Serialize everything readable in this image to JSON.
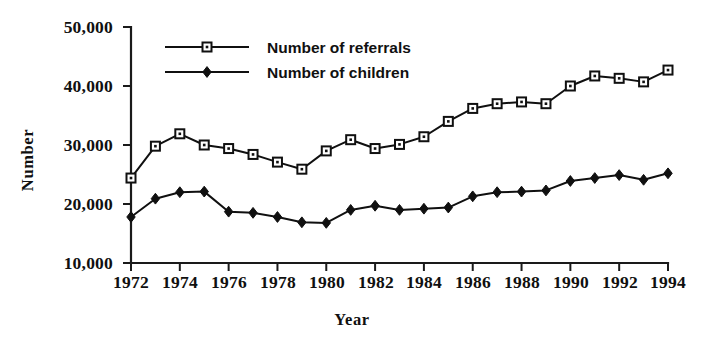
{
  "chart_data": {
    "type": "line",
    "title": "",
    "xlabel": "Year",
    "ylabel": "Number",
    "xlim": [
      1972,
      1994
    ],
    "ylim": [
      10000,
      50000
    ],
    "grid": false,
    "legend_position": "top-center",
    "x": [
      1972,
      1973,
      1974,
      1975,
      1976,
      1977,
      1978,
      1979,
      1980,
      1981,
      1982,
      1983,
      1984,
      1985,
      1986,
      1987,
      1988,
      1989,
      1990,
      1991,
      1992,
      1993,
      1994
    ],
    "xtick_labels": [
      "1972",
      "1974",
      "1976",
      "1978",
      "1980",
      "1982",
      "1984",
      "1986",
      "1988",
      "1990",
      "1992",
      "1994"
    ],
    "xticks": [
      1972,
      1974,
      1976,
      1978,
      1980,
      1982,
      1984,
      1986,
      1988,
      1990,
      1992,
      1994
    ],
    "ytick_labels": [
      "10,000",
      "20,000",
      "30,000",
      "40,000",
      "50,000"
    ],
    "yticks": [
      10000,
      20000,
      30000,
      40000,
      50000
    ],
    "series": [
      {
        "name": "Number of referrals",
        "marker": "open-square",
        "values": [
          24400,
          29800,
          31900,
          30000,
          29400,
          28400,
          27100,
          25900,
          29000,
          30900,
          29400,
          30100,
          31400,
          34000,
          36200,
          37000,
          37300,
          37000,
          40000,
          41700,
          41300,
          40700,
          42700
        ]
      },
      {
        "name": "Number of children",
        "marker": "filled-diamond",
        "values": [
          17800,
          20900,
          22000,
          22100,
          18700,
          18500,
          17800,
          16900,
          16800,
          19000,
          19700,
          19000,
          19200,
          19400,
          21300,
          22000,
          22100,
          22300,
          23900,
          24400,
          24900,
          24100,
          25200
        ]
      }
    ],
    "legend": [
      {
        "label": "Number of referrals",
        "marker": "open-square"
      },
      {
        "label": "Number of children",
        "marker": "filled-diamond"
      }
    ]
  },
  "axis": {
    "y_title": "Number",
    "x_title": "Year"
  }
}
